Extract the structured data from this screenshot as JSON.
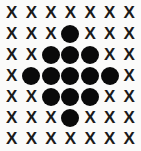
{
  "figure": {
    "background_color": "#fbfbfa",
    "mark_color": "#0a0a0a",
    "rows": 7,
    "columns": 7,
    "x_glyph": "X",
    "dot_glyph": "●"
  },
  "chart_data": {
    "type": "heatmap",
    "title": "",
    "xlabel": "",
    "ylabel": "",
    "categories": [
      "1",
      "2",
      "3",
      "4",
      "5",
      "6",
      "7"
    ],
    "row_labels": [
      "1",
      "2",
      "3",
      "4",
      "5",
      "6",
      "7"
    ],
    "legend": [
      {
        "symbol": "X",
        "name": "unfilled cell",
        "color": "#1a1a1a"
      },
      {
        "symbol": "●",
        "name": "filled cell",
        "color": "#0a0a0a"
      }
    ],
    "grid": [
      [
        "X",
        "X",
        "X",
        "X",
        "X",
        "X",
        "X"
      ],
      [
        "X",
        "X",
        "X",
        "●",
        "X",
        "X",
        "X"
      ],
      [
        "X",
        "X",
        "●",
        "●",
        "●",
        "X",
        "X"
      ],
      [
        "X",
        "●",
        "●",
        "●",
        "●",
        "●",
        "X"
      ],
      [
        "X",
        "X",
        "●",
        "●",
        "●",
        "X",
        "X"
      ],
      [
        "X",
        "X",
        "X",
        "●",
        "X",
        "X",
        "X"
      ],
      [
        "X",
        "X",
        "X",
        "X",
        "X",
        "X",
        "X"
      ]
    ],
    "values": [
      [
        0,
        0,
        0,
        0,
        0,
        0,
        0
      ],
      [
        0,
        0,
        0,
        1,
        0,
        0,
        0
      ],
      [
        0,
        0,
        1,
        1,
        1,
        0,
        0
      ],
      [
        0,
        1,
        1,
        1,
        1,
        1,
        0
      ],
      [
        0,
        0,
        1,
        1,
        1,
        0,
        0
      ],
      [
        0,
        0,
        0,
        1,
        0,
        0,
        0
      ],
      [
        0,
        0,
        0,
        0,
        0,
        0,
        0
      ]
    ],
    "filled_count": 13,
    "total_cells": 49
  }
}
